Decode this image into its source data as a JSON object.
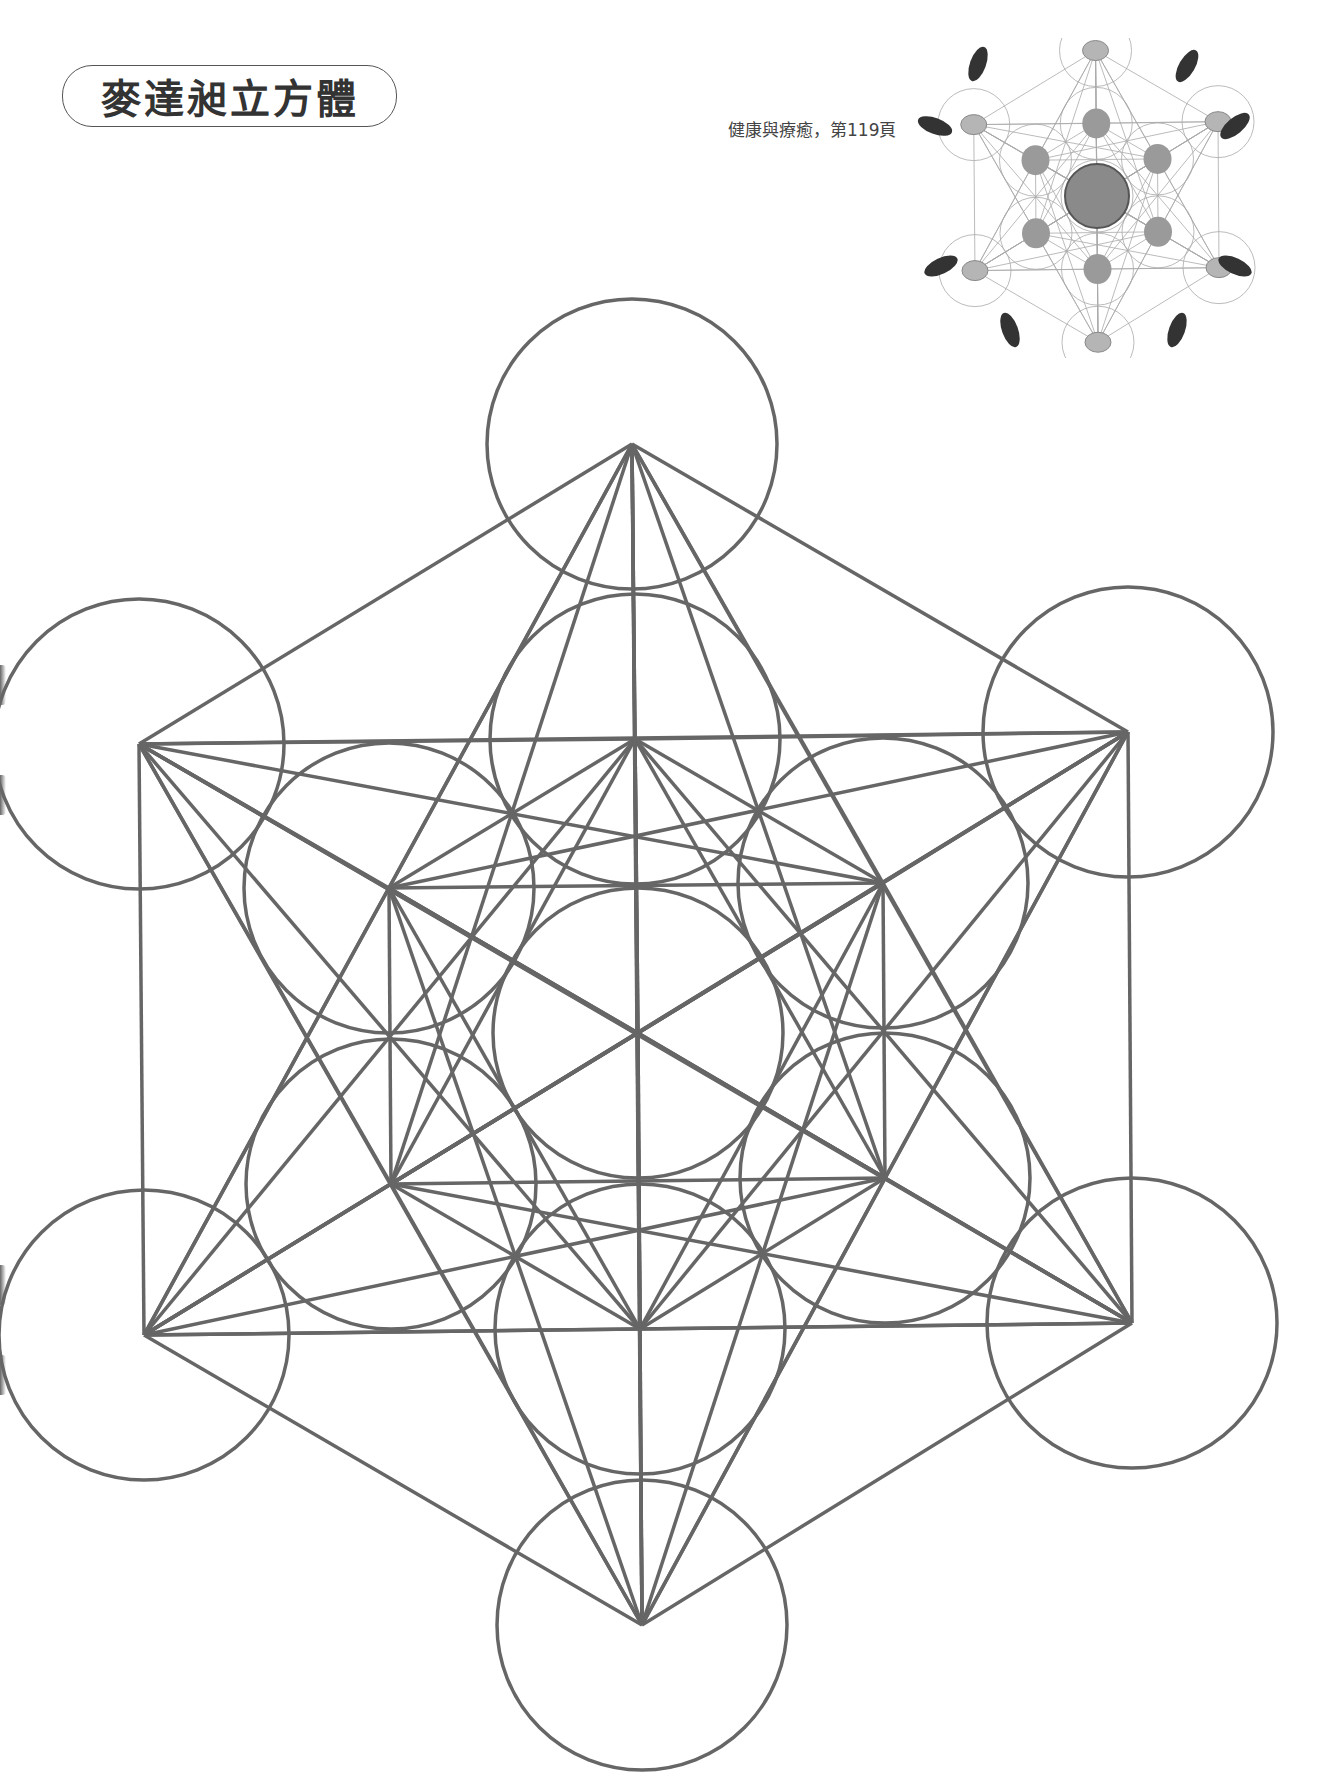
{
  "header": {
    "title": "麥達昶立方體",
    "reference": "健康與療癒，第119頁"
  },
  "colors": {
    "line": "#666666",
    "text": "#333333",
    "background": "#ffffff"
  },
  "photo": {
    "description": "crystal-grid-photo",
    "stones": 13,
    "outer_stones_dark": 6
  },
  "diagram": {
    "name": "metatrons-cube",
    "stroke_width": 3.5,
    "circle_radius": 145,
    "center": [
      638,
      1033
    ],
    "outer_vertices": [
      [
        632,
        444
      ],
      [
        1128,
        732
      ],
      [
        1132,
        1323
      ],
      [
        642,
        1625
      ],
      [
        144,
        1335
      ],
      [
        139,
        744
      ]
    ],
    "inner_vertices": [
      [
        635,
        739
      ],
      [
        883,
        883
      ],
      [
        885,
        1178
      ],
      [
        640,
        1329
      ],
      [
        391,
        1184
      ],
      [
        389,
        888
      ]
    ]
  }
}
